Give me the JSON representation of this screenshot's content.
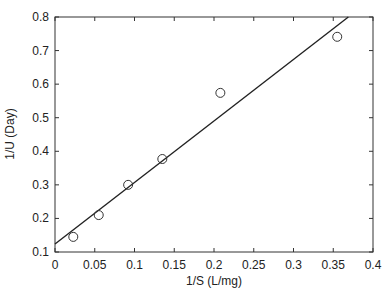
{
  "chart_data": {
    "type": "scatter",
    "title": "",
    "xlabel": "1/S (L/mg)",
    "ylabel": "1/U (Day)",
    "xlim": [
      0,
      0.4
    ],
    "ylim": [
      0.1,
      0.8
    ],
    "xticks": [
      0,
      0.05,
      0.1,
      0.15,
      0.2,
      0.25,
      0.3,
      0.35,
      0.4
    ],
    "xtick_labels": [
      "0",
      "0.05",
      "0.1",
      "0.15",
      "0.2",
      "0.25",
      "0.3",
      "0.35",
      "0.4"
    ],
    "yticks": [
      0.1,
      0.2,
      0.3,
      0.4,
      0.5,
      0.6,
      0.7,
      0.8
    ],
    "ytick_labels": [
      "0.1",
      "0.2",
      "0.3",
      "0.4",
      "0.5",
      "0.6",
      "0.7",
      "0.8"
    ],
    "grid": false,
    "legend": null,
    "series": [
      {
        "name": "observed",
        "marker": "open-circle",
        "x": [
          0.023,
          0.055,
          0.092,
          0.135,
          0.208,
          0.355
        ],
        "y": [
          0.145,
          0.21,
          0.3,
          0.377,
          0.574,
          0.741
        ]
      },
      {
        "name": "linear fit",
        "type": "line",
        "intercept": 0.124,
        "slope": 1.83,
        "x": [
          0,
          0.369
        ],
        "y": [
          0.124,
          0.8
        ]
      }
    ]
  },
  "colors": {
    "axis": "#333333",
    "line": "#222222",
    "marker": "#333333"
  }
}
